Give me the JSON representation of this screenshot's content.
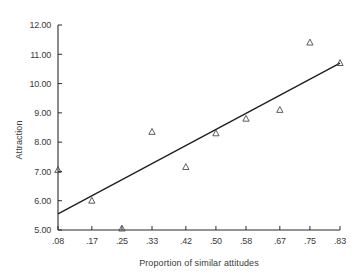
{
  "chart_data": {
    "type": "scatter",
    "title": "",
    "xlabel": "Proportion of similar attitudes",
    "ylabel": "Attraction",
    "xlim": [
      0.08,
      0.83
    ],
    "ylim": [
      5.0,
      12.0
    ],
    "grid": false,
    "legend": null,
    "x_tick_labels": [
      ".08",
      ".17",
      ".25",
      ".33",
      ".42",
      ".50",
      ".58",
      ".67",
      ".75",
      ".83"
    ],
    "x_tick_values": [
      0.08,
      0.17,
      0.25,
      0.33,
      0.42,
      0.5,
      0.58,
      0.67,
      0.75,
      0.83
    ],
    "y_tick_labels": [
      "5.00",
      "6.00",
      "7.00",
      "8.00",
      "9.00",
      "10.00",
      "11.00",
      "12.00"
    ],
    "y_tick_values": [
      5.0,
      6.0,
      7.0,
      8.0,
      9.0,
      10.0,
      11.0,
      12.0
    ],
    "marker_symbol": "triangle",
    "x": [
      0.08,
      0.17,
      0.25,
      0.33,
      0.42,
      0.5,
      0.58,
      0.67,
      0.75,
      0.83
    ],
    "y": [
      7.05,
      6.0,
      5.05,
      8.35,
      7.15,
      8.3,
      8.8,
      9.1,
      11.4,
      10.7
    ],
    "points": [
      {
        "x": 0.08,
        "y": 7.05
      },
      {
        "x": 0.17,
        "y": 6.0
      },
      {
        "x": 0.25,
        "y": 5.05
      },
      {
        "x": 0.33,
        "y": 8.35
      },
      {
        "x": 0.42,
        "y": 7.15
      },
      {
        "x": 0.5,
        "y": 8.3
      },
      {
        "x": 0.58,
        "y": 8.8
      },
      {
        "x": 0.67,
        "y": 9.1
      },
      {
        "x": 0.75,
        "y": 11.4
      },
      {
        "x": 0.83,
        "y": 10.7
      }
    ],
    "fit_line": {
      "x_start": 0.08,
      "y_start": 5.55,
      "x_end": 0.83,
      "y_end": 10.7
    },
    "colors": {
      "axis": "#2b2b2b",
      "line": "#1d1d1d",
      "marker": "#4a4a4a",
      "text": "#3a3a3a",
      "background": "#ffffff"
    }
  }
}
